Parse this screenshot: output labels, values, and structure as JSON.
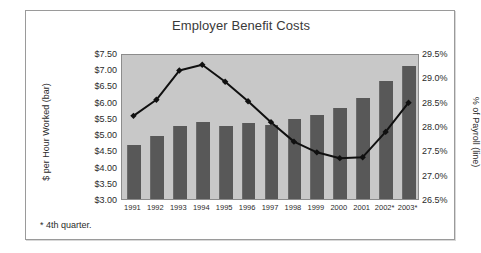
{
  "chart_data": {
    "type": "bar",
    "title": "Employer Benefit Costs",
    "xlabel": "",
    "ylabel": "$ per Hour Worked (bar)",
    "y2label": "% of Payroll (line)",
    "grid": false,
    "legend": "none",
    "categories": [
      "1991",
      "1992",
      "1993",
      "1994",
      "1995",
      "1996",
      "1997",
      "1998",
      "1999",
      "2000",
      "2001",
      "2002*",
      "2003*"
    ],
    "ylim": [
      3.0,
      7.5
    ],
    "y2lim": [
      26.5,
      29.5
    ],
    "yticks": [
      "$7.50",
      "$7.00",
      "$6.50",
      "$6.00",
      "$5.50",
      "$5.00",
      "$4.50",
      "$4.00",
      "$3.50",
      "$3.00"
    ],
    "ytick_values": [
      7.5,
      7.0,
      6.5,
      6.0,
      5.5,
      5.0,
      4.5,
      4.0,
      3.5,
      3.0
    ],
    "y2ticks": [
      "29.5%",
      "29.0%",
      "28.5%",
      "28.0%",
      "27.5%",
      "27.0%",
      "26.5%"
    ],
    "y2tick_values": [
      29.5,
      29.0,
      28.5,
      28.0,
      27.5,
      27.0,
      26.5
    ],
    "series": [
      {
        "name": "$ per Hour Worked",
        "kind": "bar",
        "axis": "left",
        "color": "#585858",
        "values": [
          4.65,
          4.95,
          5.25,
          5.38,
          5.25,
          5.33,
          5.28,
          5.48,
          5.6,
          5.8,
          6.1,
          6.65,
          7.1
        ]
      },
      {
        "name": "% of Payroll",
        "kind": "line",
        "axis": "right",
        "color": "#101010",
        "marker": "diamond",
        "values": [
          28.25,
          28.58,
          29.18,
          29.3,
          28.95,
          28.55,
          28.12,
          27.72,
          27.5,
          27.38,
          27.4,
          27.92,
          28.52
        ]
      }
    ],
    "annotations": [
      "* 4th quarter."
    ]
  },
  "footnote": "* 4th quarter.",
  "colors": {
    "plot_background": "#c8c8c8",
    "bar": "#585858",
    "line": "#101010",
    "frame": "#9a9a9a",
    "text": "#2b2b2b",
    "title_text": "#3a3a3a"
  }
}
